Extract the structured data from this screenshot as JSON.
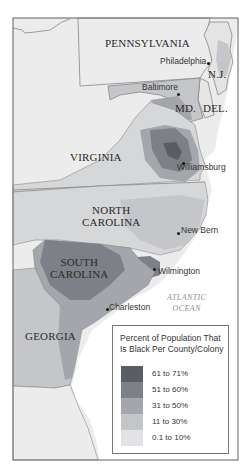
{
  "map": {
    "title": "Percent of Population That Is Black Per County/Colony",
    "states": [
      {
        "name": "PENNSYLVANIA"
      },
      {
        "name": "N.J."
      },
      {
        "name": "MD."
      },
      {
        "name": "DEL."
      },
      {
        "name": "VIRGINIA"
      },
      {
        "name": "NORTH",
        "name2": "CAROLINA"
      },
      {
        "name": "SOUTH",
        "name2": "CAROLINA"
      },
      {
        "name": "GEORGIA"
      }
    ],
    "cities": [
      {
        "name": "Philadelphia"
      },
      {
        "name": "Baltimore"
      },
      {
        "name": "Williamsburg"
      },
      {
        "name": "New Bern"
      },
      {
        "name": "Wilmington"
      },
      {
        "name": "Charleston"
      }
    ],
    "water": {
      "line1": "ATLANTIC",
      "line2": "OCEAN"
    }
  },
  "legend": {
    "title": "Percent of Population That Is Black Per County/Colony",
    "items": [
      {
        "label": "61 to 71%",
        "color": "#5a5d62"
      },
      {
        "label": "51 to 60%",
        "color": "#7d8086"
      },
      {
        "label": "31 to 50%",
        "color": "#a3a6ab"
      },
      {
        "label": "11 to 30%",
        "color": "#c4c6c9"
      },
      {
        "label": "0.1 to 10%",
        "color": "#e2e3e4"
      }
    ]
  },
  "colors": {
    "land_none": "#ececec",
    "frame": "#7a7a7a",
    "border": "#8a8a8a",
    "water": "#ffffff"
  }
}
